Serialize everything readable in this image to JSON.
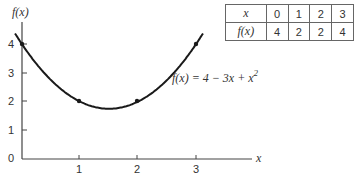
{
  "chart_data": {
    "type": "line",
    "title": "",
    "xlabel": "x",
    "ylabel": "f(x)",
    "equation_label": "f(x) = 4 − 3x + x²",
    "x_ticks": [
      "1",
      "2",
      "3"
    ],
    "y_ticks": [
      "1",
      "2",
      "3",
      "4"
    ],
    "origin_label": "0",
    "xlim": [
      0,
      3.8
    ],
    "ylim": [
      0,
      4.4
    ],
    "grid": false,
    "series": [
      {
        "name": "f(x) = 4 - 3x + x^2",
        "x": [
          0,
          1,
          2,
          3
        ],
        "y": [
          4,
          2,
          2,
          4
        ]
      }
    ],
    "marked_points": [
      [
        0,
        4
      ],
      [
        1,
        2
      ],
      [
        2,
        2
      ],
      [
        3,
        4
      ]
    ],
    "table": {
      "headers": [
        "x",
        "f(x)"
      ],
      "x_values": [
        "0",
        "1",
        "2",
        "3"
      ],
      "fx_values": [
        "4",
        "2",
        "2",
        "4"
      ]
    }
  },
  "labels": {
    "ylabel": "f(x)",
    "xlabel": "x",
    "origin": "0",
    "equation": "f(x) = 4 − 3x + x",
    "equation_sup": "2",
    "xt1": "1",
    "xt2": "2",
    "xt3": "3",
    "yt1": "1",
    "yt2": "2",
    "yt3": "3",
    "yt4": "4"
  },
  "table": {
    "row1_head": "x",
    "row2_head": "f(x)",
    "row1": [
      "0",
      "1",
      "2",
      "3"
    ],
    "row2": [
      "4",
      "2",
      "2",
      "4"
    ]
  }
}
